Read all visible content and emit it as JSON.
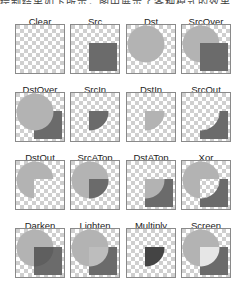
{
  "header": {
    "clipped_text": "绘制结果如下所示，图中展示了各种模式的效果"
  },
  "colors": {
    "checker_light": "#ffffff",
    "checker_dark": "#cfcfcf",
    "dst_circle": "#b3b3b3",
    "src_square": "#6b6b6b",
    "darken_overlap": "#5f5f5f",
    "lighten_overlap": "#bdbdbd",
    "multiply_overlap": "#444444",
    "screen_overlap": "#e6e6e6",
    "tile_border": "#8a8a8a"
  },
  "modes": [
    {
      "label": "Clear",
      "mode": "clear"
    },
    {
      "label": "Src",
      "mode": "src"
    },
    {
      "label": "Dst",
      "mode": "dst"
    },
    {
      "label": "SrcOver",
      "mode": "srcover"
    },
    {
      "label": "DstOver",
      "mode": "dstover"
    },
    {
      "label": "SrcIn",
      "mode": "srcin"
    },
    {
      "label": "DstIn",
      "mode": "dstin"
    },
    {
      "label": "SrcOut",
      "mode": "srcout"
    },
    {
      "label": "DstOut",
      "mode": "dstout"
    },
    {
      "label": "SrcATop",
      "mode": "srcatop"
    },
    {
      "label": "DstATop",
      "mode": "dstatop"
    },
    {
      "label": "Xor",
      "mode": "xor"
    },
    {
      "label": "Darken",
      "mode": "darken"
    },
    {
      "label": "Lighten",
      "mode": "lighten"
    },
    {
      "label": "Multiply",
      "mode": "multiply"
    },
    {
      "label": "Screen",
      "mode": "screen"
    }
  ]
}
